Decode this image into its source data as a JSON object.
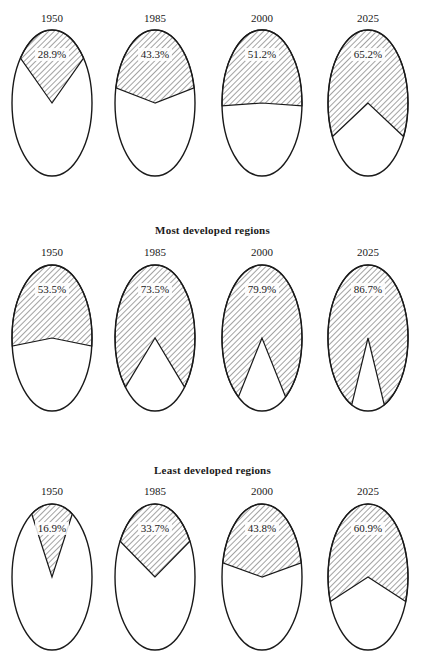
{
  "chart_data": [
    {
      "type": "pie",
      "title": "",
      "section": "World",
      "categories": [
        "1950",
        "1985",
        "2000",
        "2025"
      ],
      "values": [
        28.9,
        43.3,
        51.2,
        65.2
      ],
      "labels": [
        "28.9%",
        "43.3%",
        "51.2%",
        "65.2%"
      ],
      "style": "elliptical pie, hatched slice centered at top"
    },
    {
      "type": "pie",
      "title": "Most developed regions",
      "categories": [
        "1950",
        "1985",
        "2000",
        "2025"
      ],
      "values": [
        53.5,
        73.5,
        79.9,
        86.7
      ],
      "labels": [
        "53.5%",
        "73.5%",
        "79.9%",
        "86.7%"
      ],
      "style": "elliptical pie, hatched slice centered at top"
    },
    {
      "type": "pie",
      "title": "Least developed regions",
      "categories": [
        "1950",
        "1985",
        "2000",
        "2025"
      ],
      "values": [
        16.9,
        33.7,
        43.8,
        60.9
      ],
      "labels": [
        "16.9%",
        "33.7%",
        "43.8%",
        "60.9%"
      ],
      "style": "elliptical pie, hatched slice centered at top"
    }
  ],
  "sections": [
    {
      "title": "",
      "year_y": 22,
      "cy": 103,
      "title_y": 0
    },
    {
      "title": "Most developed regions",
      "year_y": 256,
      "cy": 338,
      "title_y": 224
    },
    {
      "title": "Least developed regions",
      "year_y": 495,
      "cy": 577,
      "title_y": 464
    }
  ],
  "columns_x": [
    52,
    155,
    262,
    368
  ],
  "ellipse": {
    "rx": 40,
    "ry": 73
  },
  "colors": {
    "stroke": "#1a1a1a",
    "hatch": "#333333",
    "fill": "#ffffff"
  }
}
